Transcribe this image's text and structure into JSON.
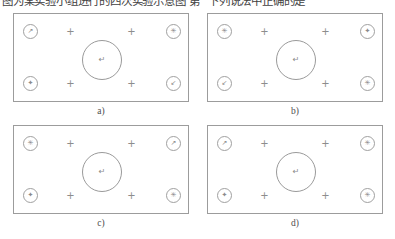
{
  "heading": {
    "left_text": "图为某实验小组进行的四次实验示意图 第",
    "right_text": "下列说法中正确的是"
  },
  "figure": {
    "panels": [
      {
        "id": "panel-a",
        "caption": "a)",
        "nodes": {
          "top_left": "↗",
          "top_right": "✳",
          "bottom_left": "✦",
          "bottom_right": "↙"
        },
        "center_node": "↵",
        "markers": [
          "+",
          "+",
          "+",
          "+"
        ]
      },
      {
        "id": "panel-b",
        "caption": "b)",
        "nodes": {
          "top_left": "✳",
          "top_right": "✦",
          "bottom_left": "↙",
          "bottom_right": "✳"
        },
        "center_node": "↵",
        "markers": [
          "+",
          "+",
          "+",
          "+"
        ]
      },
      {
        "id": "panel-c",
        "caption": "c)",
        "nodes": {
          "top_left": "✳",
          "top_right": "↗",
          "bottom_left": "✦",
          "bottom_right": "✳"
        },
        "center_node": "↵",
        "markers": [
          "+",
          "+",
          "+",
          "+"
        ]
      },
      {
        "id": "panel-d",
        "caption": "d)",
        "nodes": {
          "top_left": "↗",
          "top_right": "✳",
          "bottom_left": "✦",
          "bottom_right": "✳"
        },
        "center_node": "↵",
        "markers": [
          "+",
          "+",
          "+",
          "+"
        ]
      }
    ]
  },
  "colors": {
    "panel_border": "#9c9c9c",
    "node_border": "#a0a0a0",
    "glyph": "#8a8a8a",
    "caption": "#4d4d4d",
    "background": "#ffffff"
  }
}
